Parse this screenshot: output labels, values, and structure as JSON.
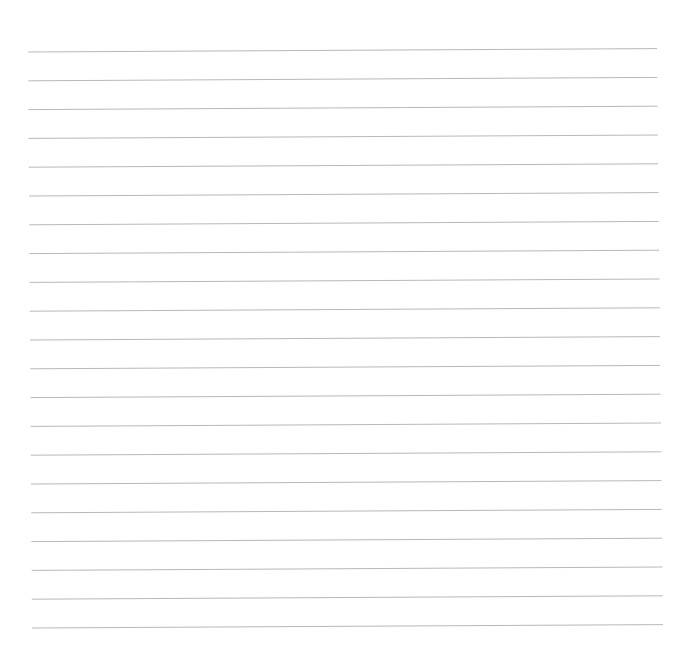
{
  "document": {
    "kind": "lined-paper-scan",
    "page_label": "",
    "written_text": "",
    "canvas": {
      "width": 691,
      "height": 654
    }
  },
  "appearance": {
    "background_color": "#ffffff",
    "rule_color": "#b4b4b8",
    "rule_thickness": 1,
    "rule_opacity": 0.95
  },
  "ruling": {
    "line_count": 21,
    "first_line_y_left": 52,
    "line_spacing": 28.8,
    "left_x_top": 28,
    "left_x_bottom": 32,
    "right_x_top": 657,
    "right_x_bottom": 663,
    "tilt_rise_px": 3.5,
    "top_margin": 50,
    "bottom_margin": 26
  },
  "lines": [
    {
      "index": 1,
      "x1": 28.0,
      "y1": 52.0,
      "x2": 657.0,
      "y2": 48.6
    },
    {
      "index": 2,
      "x1": 28.2,
      "y1": 80.8,
      "x2": 657.3,
      "y2": 77.4
    },
    {
      "index": 3,
      "x1": 28.4,
      "y1": 109.6,
      "x2": 657.6,
      "y2": 106.2
    },
    {
      "index": 4,
      "x1": 28.6,
      "y1": 138.4,
      "x2": 657.9,
      "y2": 135.0
    },
    {
      "index": 5,
      "x1": 28.8,
      "y1": 167.2,
      "x2": 658.2,
      "y2": 163.8
    },
    {
      "index": 6,
      "x1": 29.0,
      "y1": 196.0,
      "x2": 658.5,
      "y2": 192.6
    },
    {
      "index": 7,
      "x1": 29.2,
      "y1": 224.8,
      "x2": 658.8,
      "y2": 221.4
    },
    {
      "index": 8,
      "x1": 29.4,
      "y1": 253.6,
      "x2": 659.1,
      "y2": 250.2
    },
    {
      "index": 9,
      "x1": 29.6,
      "y1": 282.4,
      "x2": 659.4,
      "y2": 279.0
    },
    {
      "index": 10,
      "x1": 29.8,
      "y1": 311.2,
      "x2": 659.7,
      "y2": 307.8
    },
    {
      "index": 11,
      "x1": 30.0,
      "y1": 340.0,
      "x2": 660.0,
      "y2": 336.6
    },
    {
      "index": 12,
      "x1": 30.2,
      "y1": 368.8,
      "x2": 660.3,
      "y2": 365.4
    },
    {
      "index": 13,
      "x1": 30.4,
      "y1": 397.6,
      "x2": 660.6,
      "y2": 394.2
    },
    {
      "index": 14,
      "x1": 30.6,
      "y1": 426.4,
      "x2": 660.9,
      "y2": 423.0
    },
    {
      "index": 15,
      "x1": 30.8,
      "y1": 455.2,
      "x2": 661.2,
      "y2": 451.8
    },
    {
      "index": 16,
      "x1": 31.0,
      "y1": 484.0,
      "x2": 661.5,
      "y2": 480.6
    },
    {
      "index": 17,
      "x1": 31.2,
      "y1": 512.8,
      "x2": 661.8,
      "y2": 509.4
    },
    {
      "index": 18,
      "x1": 31.4,
      "y1": 541.6,
      "x2": 662.1,
      "y2": 538.2
    },
    {
      "index": 19,
      "x1": 31.6,
      "y1": 570.4,
      "x2": 662.4,
      "y2": 567.0
    },
    {
      "index": 20,
      "x1": 31.8,
      "y1": 599.2,
      "x2": 662.7,
      "y2": 595.8
    },
    {
      "index": 21,
      "x1": 32.0,
      "y1": 628.0,
      "x2": 663.0,
      "y2": 624.6
    }
  ]
}
